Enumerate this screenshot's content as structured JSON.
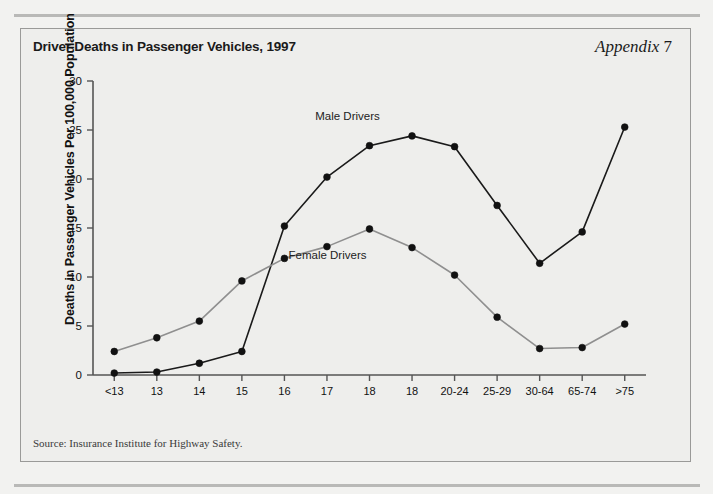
{
  "panel": {
    "title": "Driver Deaths in Passenger Vehicles, 1997",
    "appendix_label": "Appendix",
    "appendix_number": "7",
    "source_note": "Source: Insurance Institute for Highway Safety."
  },
  "colors": {
    "page_background": "#f2f2f0",
    "panel_background": "#eeeeec",
    "panel_border": "#9a9a98",
    "rule": "#b9b9b7",
    "male_line": "#1a1a1a",
    "female_line": "#8f8f8f",
    "marker": "#111111",
    "axis": "#555555",
    "text": "#111111"
  },
  "chart_data": {
    "type": "line",
    "title": "Driver Deaths in Passenger Vehicles, 1997",
    "xlabel": "",
    "ylabel": "Deaths in Passenger Vehicles Per 100,000 Population",
    "categories": [
      "<13",
      "13",
      "14",
      "15",
      "16",
      "17",
      "18",
      "18",
      "20-24",
      "25-29",
      "30-64",
      "65-74",
      ">75"
    ],
    "xtick_labels": [
      "<13",
      "13",
      "14",
      "15",
      "16",
      "17",
      "18",
      "18",
      "20-24",
      "25-29",
      "30-64",
      "65-74",
      ">75"
    ],
    "ytick_labels": [
      "0",
      "5",
      "10",
      "15",
      "20",
      "25",
      "30"
    ],
    "yticks": [
      0,
      5,
      10,
      15,
      20,
      25,
      30
    ],
    "ylim": [
      0,
      30
    ],
    "grid": false,
    "legend_position": "inline-annotation",
    "series": [
      {
        "name": "Male Drivers",
        "color": "#1a1a1a",
        "annotation": "Male Drivers",
        "values": [
          0.2,
          0.3,
          1.2,
          2.4,
          15.2,
          20.2,
          23.4,
          24.4,
          23.3,
          17.3,
          11.4,
          14.6,
          25.3
        ]
      },
      {
        "name": "Female Drivers",
        "color": "#8f8f8f",
        "annotation": "Female Drivers",
        "values": [
          2.4,
          3.8,
          5.5,
          9.6,
          11.9,
          13.1,
          14.9,
          13.0,
          10.2,
          5.9,
          2.7,
          2.8,
          5.2
        ]
      }
    ]
  }
}
